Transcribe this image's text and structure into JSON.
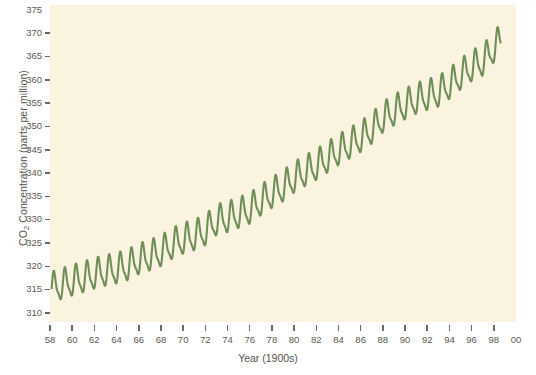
{
  "chart_data": {
    "type": "line",
    "title": "",
    "xlabel": "Year (1900s)",
    "ylabel": "CO2 Concentration (parts per million)",
    "ylabel_prefix": "CO",
    "ylabel_sub": "2",
    "ylabel_suffix": " Concentration (parts per million)",
    "xlim": [
      58,
      100
    ],
    "ylim": [
      308,
      376
    ],
    "ytick_values": [
      375,
      370,
      365,
      360,
      355,
      350,
      345,
      340,
      335,
      330,
      325,
      320,
      315,
      310
    ],
    "ytick_labels": [
      "375",
      "370",
      "365",
      "360",
      "355",
      "350",
      "345",
      "340",
      "335",
      "330",
      "325",
      "320",
      "315",
      "310"
    ],
    "xtick_values": [
      58,
      60,
      62,
      64,
      66,
      68,
      70,
      72,
      74,
      76,
      78,
      80,
      82,
      84,
      86,
      88,
      90,
      92,
      94,
      96,
      98,
      100
    ],
    "xtick_labels": [
      "58",
      "60",
      "62",
      "64",
      "66",
      "68",
      "70",
      "72",
      "74",
      "76",
      "78",
      "80",
      "82",
      "84",
      "86",
      "88",
      "90",
      "92",
      "94",
      "96",
      "98",
      "00"
    ],
    "grid": false,
    "legend": "none",
    "series": [
      {
        "name": "Mauna Loa monthly mean CO2",
        "color": "#6f8e58",
        "line_width": 2.1,
        "description": "Keeling curve: rising trend with seasonal sawtooth oscillation (~6 ppm peak-to-trough)",
        "annual_mean": [
          {
            "year": 1958,
            "value": 315.0
          },
          {
            "year": 1959,
            "value": 315.8
          },
          {
            "year": 1960,
            "value": 316.6
          },
          {
            "year": 1961,
            "value": 317.3
          },
          {
            "year": 1962,
            "value": 318.1
          },
          {
            "year": 1963,
            "value": 318.7
          },
          {
            "year": 1964,
            "value": 319.2
          },
          {
            "year": 1965,
            "value": 319.9
          },
          {
            "year": 1966,
            "value": 321.2
          },
          {
            "year": 1967,
            "value": 322.0
          },
          {
            "year": 1968,
            "value": 322.9
          },
          {
            "year": 1969,
            "value": 324.5
          },
          {
            "year": 1970,
            "value": 325.6
          },
          {
            "year": 1971,
            "value": 326.3
          },
          {
            "year": 1972,
            "value": 327.4
          },
          {
            "year": 1973,
            "value": 329.6
          },
          {
            "year": 1974,
            "value": 330.2
          },
          {
            "year": 1975,
            "value": 331.1
          },
          {
            "year": 1976,
            "value": 332.0
          },
          {
            "year": 1977,
            "value": 333.8
          },
          {
            "year": 1978,
            "value": 335.4
          },
          {
            "year": 1979,
            "value": 336.8
          },
          {
            "year": 1980,
            "value": 338.7
          },
          {
            "year": 1981,
            "value": 340.1
          },
          {
            "year": 1982,
            "value": 341.4
          },
          {
            "year": 1983,
            "value": 343.0
          },
          {
            "year": 1984,
            "value": 344.6
          },
          {
            "year": 1985,
            "value": 346.0
          },
          {
            "year": 1986,
            "value": 347.4
          },
          {
            "year": 1987,
            "value": 349.2
          },
          {
            "year": 1988,
            "value": 351.6
          },
          {
            "year": 1989,
            "value": 353.1
          },
          {
            "year": 1990,
            "value": 354.4
          },
          {
            "year": 1991,
            "value": 355.6
          },
          {
            "year": 1992,
            "value": 356.4
          },
          {
            "year": 1993,
            "value": 357.1
          },
          {
            "year": 1994,
            "value": 358.8
          },
          {
            "year": 1995,
            "value": 360.8
          },
          {
            "year": 1996,
            "value": 362.6
          },
          {
            "year": 1997,
            "value": 363.8
          },
          {
            "year": 1998,
            "value": 366.6
          }
        ],
        "seasonal_amplitude": 6.0,
        "seasonal_peak_month": 5,
        "start_value": 313.2,
        "end_value": 369.0
      }
    ],
    "colors": {
      "plot_background": "#faf3e0",
      "page_background": "#ffffff",
      "line": "#6f8e58",
      "axis_text": "#5d5a55",
      "tick_mark": "#6e6a63"
    }
  }
}
